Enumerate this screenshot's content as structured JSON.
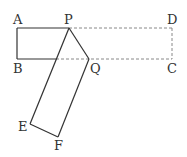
{
  "diagram": {
    "type": "geometry-fold",
    "labels": {
      "A": "A",
      "P": "P",
      "D": "D",
      "B": "B",
      "Q": "Q",
      "C": "C",
      "E": "E",
      "F": "F"
    },
    "colors": {
      "line": "#333333",
      "dashed": "#888888",
      "background": "#ffffff"
    }
  }
}
